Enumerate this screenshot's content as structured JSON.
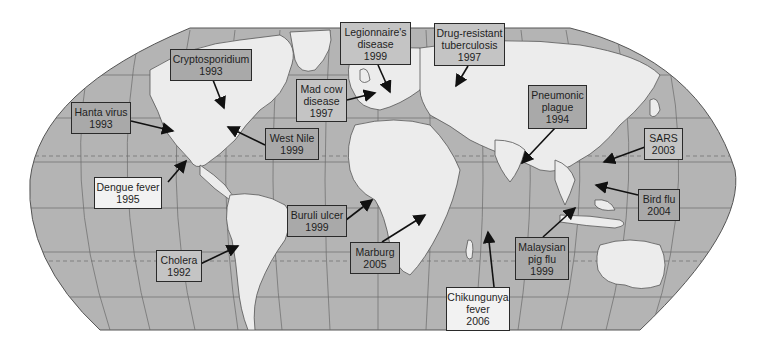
{
  "map": {
    "title": "Emerging and re-emerging infectious diseases world map",
    "projection": "Robinson-style world map",
    "colors": {
      "ocean": "#b4b4b4",
      "land": "#ececec",
      "border": "#555555",
      "box_dark": "#a9a9a9",
      "box_mid": "#c4c4c4",
      "box_light": "#f2f2f2",
      "arrow": "#111111"
    },
    "labels": [
      {
        "id": "cryptosporidium",
        "lines": [
          "Cryptosporidium",
          "1993"
        ],
        "style": "dark"
      },
      {
        "id": "hanta",
        "lines": [
          "Hanta virus",
          "1993"
        ],
        "style": "dark"
      },
      {
        "id": "west-nile",
        "lines": [
          "West Nile",
          "1999"
        ],
        "style": "dark"
      },
      {
        "id": "mad-cow",
        "lines": [
          "Mad cow",
          "disease",
          "1997"
        ],
        "style": "mid"
      },
      {
        "id": "legionnaires",
        "lines": [
          "Legionnaire's",
          "disease",
          "1999"
        ],
        "style": "mid"
      },
      {
        "id": "tb",
        "lines": [
          "Drug-resistant",
          "tuberculosis",
          "1997"
        ],
        "style": "mid"
      },
      {
        "id": "pneumonic",
        "lines": [
          "Pneumonic",
          "plague",
          "1994"
        ],
        "style": "dark"
      },
      {
        "id": "sars",
        "lines": [
          "SARS",
          "2003"
        ],
        "style": "mid"
      },
      {
        "id": "dengue",
        "lines": [
          "Dengue fever",
          "1995"
        ],
        "style": "light"
      },
      {
        "id": "bird-flu",
        "lines": [
          "Bird flu",
          "2004"
        ],
        "style": "dark"
      },
      {
        "id": "buruli",
        "lines": [
          "Buruli ulcer",
          "1999"
        ],
        "style": "dark"
      },
      {
        "id": "malaysian",
        "lines": [
          "Malaysian",
          "pig flu",
          "1999"
        ],
        "style": "dark"
      },
      {
        "id": "cholera",
        "lines": [
          "Cholera",
          "1992"
        ],
        "style": "mid"
      },
      {
        "id": "marburg",
        "lines": [
          "Marburg",
          "2005"
        ],
        "style": "dark"
      },
      {
        "id": "chikungunya",
        "lines": [
          "Chikungunya",
          "fever",
          "2006"
        ],
        "style": "light"
      }
    ]
  }
}
